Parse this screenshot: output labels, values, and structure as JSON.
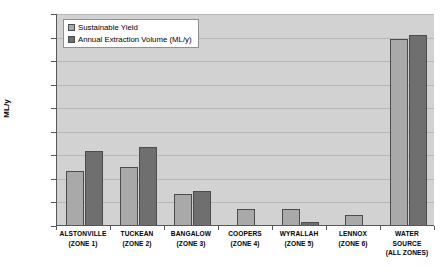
{
  "chart_data": {
    "type": "bar",
    "title": "",
    "xlabel": "",
    "ylabel": "ML/y",
    "ylim": [
      0,
      9000
    ],
    "ytick_step": 1000,
    "yticks": [
      0,
      1000,
      2000,
      3000,
      4000,
      5000,
      6000,
      7000,
      8000,
      9000
    ],
    "grid": true,
    "legend_position": "top-left",
    "categories": [
      "ALSTONVILLE (ZONE 1)",
      "TUCKEAN (ZONE 2)",
      "BANGALOW (ZONE 3)",
      "COOPERS (ZONE 4)",
      "WYRALLAH (ZONE 5)",
      "LENNOX (ZONE 6)",
      "WATER SOURCE (ALL ZONES)"
    ],
    "category_lines": [
      [
        "ALSTONVILLE",
        "(ZONE 1)"
      ],
      [
        "TUCKEAN",
        "(ZONE 2)"
      ],
      [
        "BANGALOW",
        "(ZONE 3)"
      ],
      [
        "COOPERS",
        "(ZONE 4)"
      ],
      [
        "WYRALLAH",
        "(ZONE 5)"
      ],
      [
        "LENNOX",
        "(ZONE 6)"
      ],
      [
        "WATER SOURCE",
        "(ALL ZONES)"
      ]
    ],
    "series": [
      {
        "name": "Sustainable Yield",
        "color": "#a9a9a9",
        "values": [
          2280,
          2450,
          1330,
          680,
          700,
          420,
          7900
        ]
      },
      {
        "name": "Annual Extraction Volume (ML/y)",
        "color": "#6f6f6f",
        "values": [
          3150,
          3300,
          1430,
          0,
          130,
          0,
          8050
        ]
      }
    ]
  },
  "legend": {
    "items": [
      {
        "label": "Sustainable Yield"
      },
      {
        "label": "Annual Extraction Volume (ML/y)"
      }
    ]
  },
  "axes": {
    "y_title": "ML/y"
  },
  "colors": {
    "series_0": "#a9a9a9",
    "series_1": "#6f6f6f",
    "plot_background": "#d2d2d2",
    "gridline": "#b7b7b7",
    "axis": "#55585a"
  }
}
